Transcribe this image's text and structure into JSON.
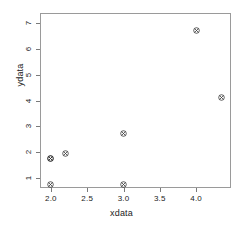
{
  "chart_data": {
    "type": "scatter",
    "title": "",
    "xlabel": "xdata",
    "ylabel": "ydata",
    "xlim": [
      1.85,
      4.48
    ],
    "ylim": [
      0.6,
      7.4
    ],
    "xticks": [
      2.0,
      2.5,
      3.0,
      3.5,
      4.0
    ],
    "xticklabels": [
      "2.0",
      "2.5",
      "3.0",
      "3.5",
      "4.0"
    ],
    "yticks": [
      1,
      2,
      3,
      4,
      5,
      6,
      7
    ],
    "yticklabels": [
      "1",
      "2",
      "3",
      "4",
      "5",
      "6",
      "7"
    ],
    "grid": false,
    "legend": null,
    "marker": "circle-with-x",
    "marker_color": "#333333",
    "frame_color": "#9a9a9a",
    "points": [
      {
        "x": 2.0,
        "y": 1.0
      },
      {
        "x": 2.0,
        "y": 2.0
      },
      {
        "x": 2.0,
        "y": 2.0
      },
      {
        "x": 2.2,
        "y": 2.2
      },
      {
        "x": 3.0,
        "y": 1.0
      },
      {
        "x": 3.0,
        "y": 3.0
      },
      {
        "x": 4.0,
        "y": 7.0
      },
      {
        "x": 4.35,
        "y": 4.4
      }
    ]
  }
}
